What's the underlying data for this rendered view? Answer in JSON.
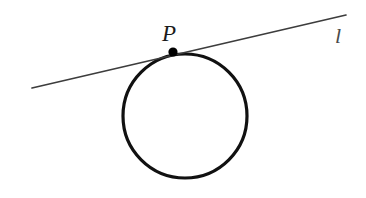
{
  "figure": {
    "background_color": "#ffffff"
  },
  "labels": {
    "point_label": "P",
    "line_label": "l"
  },
  "colors": {
    "circle_stroke": "#111111",
    "tangent_stroke": "#3d3d3d",
    "point_fill": "#000000",
    "point_label_color": "#1a1a1a",
    "line_label_color": "#4a4a4a"
  },
  "geometry": {
    "circle": {
      "name": "circle",
      "center_x": 185,
      "center_y": 116,
      "radius": 62,
      "stroke_width": 3.2
    },
    "tangent_line": {
      "name": "tangent-line",
      "x1": 32,
      "y1": 88,
      "x2": 346,
      "y2": 15,
      "stroke_width": 1.7
    },
    "tangent_point": {
      "name": "point-p",
      "cx": 173,
      "cy": 52,
      "radius": 4.6
    }
  },
  "canvas": {
    "width": 366,
    "height": 198
  }
}
